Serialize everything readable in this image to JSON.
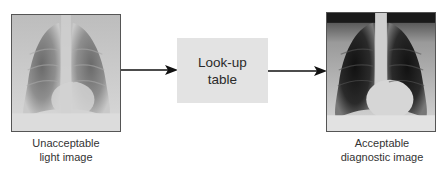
{
  "diagram": {
    "nodes": [
      {
        "id": "input",
        "type": "image",
        "icon": "chest-xray-light-image",
        "caption_lines": [
          "Unacceptable",
          "light image"
        ]
      },
      {
        "id": "lut",
        "type": "process-box",
        "label_lines": [
          "Look-up",
          "table"
        ],
        "fill": "#e3e3e3"
      },
      {
        "id": "output",
        "type": "image",
        "icon": "chest-xray-diagnostic-image",
        "caption_lines": [
          "Acceptable",
          "diagnostic image"
        ]
      }
    ],
    "edges": [
      {
        "from": "input",
        "to": "lut"
      },
      {
        "from": "lut",
        "to": "output"
      }
    ],
    "colors": {
      "arrow": "#111111",
      "image_border": "#555555",
      "text": "#333333"
    }
  }
}
